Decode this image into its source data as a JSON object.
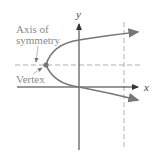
{
  "diagram": {
    "type": "parabola-opening-right",
    "labels": {
      "axis_of_symmetry_line1": "Axis of",
      "axis_of_symmetry_line2": "symmetry",
      "vertex": "Vertex",
      "x_axis": "x",
      "y_axis": "y"
    },
    "colors": {
      "curve": "#777777",
      "axes": "#333333",
      "dashed": "#999999",
      "label": "#8a8a8a",
      "vertex_point": "#777777"
    }
  }
}
